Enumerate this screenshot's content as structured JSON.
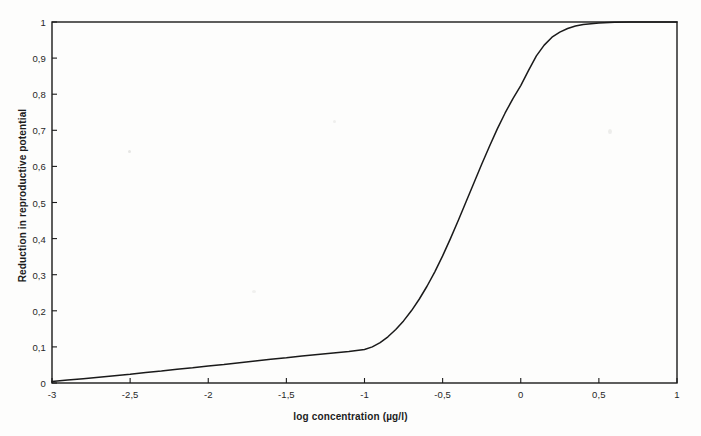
{
  "chart_data": {
    "type": "line",
    "title": "",
    "xlabel": "log concentration (µg/l)",
    "ylabel": "Reduction in reproductive potential",
    "xlim": [
      -3,
      1
    ],
    "ylim": [
      0,
      1
    ],
    "grid": false,
    "legend": null,
    "line_color": "#1a1a1a",
    "xticks": [
      -3,
      -2.5,
      -2,
      -1.5,
      -1,
      -0.5,
      0,
      0.5,
      1
    ],
    "xtick_labels": [
      "-3",
      "-2,5",
      "-2",
      "-1,5",
      "-1",
      "-0,5",
      "0",
      "0,5",
      "1"
    ],
    "yticks": [
      0,
      0.1,
      0.2,
      0.3,
      0.4,
      0.5,
      0.6,
      0.7,
      0.8,
      0.9,
      1
    ],
    "ytick_labels": [
      "0",
      "0,1",
      "0,2",
      "0,3",
      "0,4",
      "0,5",
      "0,6",
      "0,7",
      "0,8",
      "0,9",
      "1"
    ],
    "series": [
      {
        "name": "reduction in reproductive potential",
        "x": [
          -3.0,
          -2.9,
          -2.8,
          -2.7,
          -2.6,
          -2.5,
          -2.4,
          -2.3,
          -2.2,
          -2.1,
          -2.0,
          -1.9,
          -1.8,
          -1.7,
          -1.6,
          -1.5,
          -1.4,
          -1.3,
          -1.2,
          -1.1,
          -1.0,
          -0.95,
          -0.9,
          -0.85,
          -0.8,
          -0.75,
          -0.7,
          -0.65,
          -0.6,
          -0.55,
          -0.5,
          -0.45,
          -0.4,
          -0.35,
          -0.3,
          -0.25,
          -0.2,
          -0.15,
          -0.1,
          -0.05,
          0.0,
          0.05,
          0.1,
          0.15,
          0.2,
          0.25,
          0.3,
          0.35,
          0.4,
          0.5,
          0.6,
          0.7,
          0.8,
          0.9,
          1.0
        ],
        "y": [
          0.004,
          0.008,
          0.012,
          0.016,
          0.02,
          0.024,
          0.029,
          0.033,
          0.038,
          0.042,
          0.047,
          0.051,
          0.056,
          0.061,
          0.066,
          0.07,
          0.075,
          0.079,
          0.083,
          0.087,
          0.093,
          0.1,
          0.112,
          0.128,
          0.148,
          0.172,
          0.2,
          0.232,
          0.268,
          0.308,
          0.352,
          0.4,
          0.45,
          0.502,
          0.554,
          0.606,
          0.656,
          0.704,
          0.748,
          0.788,
          0.824,
          0.866,
          0.906,
          0.936,
          0.958,
          0.972,
          0.982,
          0.989,
          0.993,
          0.997,
          0.999,
          1.0,
          1.0,
          1.0,
          1.0
        ]
      }
    ]
  },
  "axes": {
    "frame_color": "#1a1a1a"
  }
}
